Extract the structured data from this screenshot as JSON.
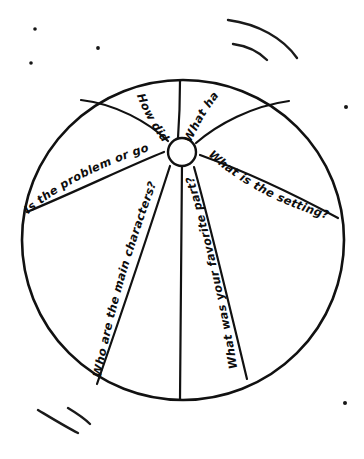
{
  "worksheet": {
    "title": "Beach Ball Story Questions",
    "description": "Hand-drawn beach ball divided into eight segments with a story comprehension question written along each seam.",
    "ink_color": "#111111",
    "background_color": "#ffffff"
  },
  "ball": {
    "name": "beach-ball",
    "segment_count": 8,
    "hub_label": "center-hub"
  },
  "questions": [
    {
      "id": "q-problem-goal",
      "text": "Is the problem or goal?",
      "position": "upper-left",
      "orientation": "upright",
      "truncated": true
    },
    {
      "id": "q-how-did-it",
      "text": "How did it",
      "position": "top-left",
      "orientation": "inverted",
      "truncated": true
    },
    {
      "id": "q-what-happened",
      "text": "What hap",
      "position": "top-right",
      "orientation": "upright",
      "truncated": true
    },
    {
      "id": "q-setting",
      "text": "What is the setting?",
      "position": "upper-right",
      "orientation": "inverted",
      "truncated": false
    },
    {
      "id": "q-main-characters",
      "text": "Who are the main characters?",
      "position": "lower-left",
      "orientation": "upright",
      "truncated": false
    },
    {
      "id": "q-favorite-part",
      "text": "What was your favorite part?",
      "position": "lower-right",
      "orientation": "upright",
      "truncated": false
    }
  ],
  "decorations": {
    "motion_arcs": [
      {
        "id": "arc-top-right-outer",
        "position": "top-right"
      },
      {
        "id": "arc-top-right-inner",
        "position": "top-right"
      },
      {
        "id": "arc-bottom-left-long",
        "position": "bottom-left"
      },
      {
        "id": "arc-bottom-left-short",
        "position": "bottom-left"
      }
    ],
    "specks": [
      {
        "id": "speck-1",
        "position": "top-left"
      },
      {
        "id": "speck-2",
        "position": "top-left-lower"
      },
      {
        "id": "speck-3",
        "position": "top-center-left"
      },
      {
        "id": "speck-4",
        "position": "right-upper"
      },
      {
        "id": "speck-5",
        "position": "right-lower"
      }
    ]
  }
}
